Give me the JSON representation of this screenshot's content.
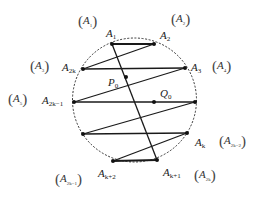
{
  "figure": {
    "type": "geometry-diagram",
    "circle": {
      "cx": 134.5,
      "cy": 100,
      "r": 62,
      "style": "dashed"
    },
    "points": [
      {
        "id": "A1",
        "x": 112,
        "y": 44
      },
      {
        "id": "A2",
        "x": 154,
        "y": 44
      },
      {
        "id": "A2k",
        "x": 83,
        "y": 69
      },
      {
        "id": "A3",
        "x": 185,
        "y": 68
      },
      {
        "id": "P0",
        "x": 126,
        "y": 77
      },
      {
        "id": "A2k-1",
        "x": 74,
        "y": 102
      },
      {
        "id": "Q0",
        "x": 154,
        "y": 102
      },
      {
        "id": "R",
        "x": 195,
        "y": 102
      },
      {
        "id": "L",
        "x": 83,
        "y": 134
      },
      {
        "id": "Ak",
        "x": 187,
        "y": 133
      },
      {
        "id": "Ak+2",
        "x": 113,
        "y": 161
      },
      {
        "id": "Ak+1",
        "x": 157,
        "y": 160
      }
    ],
    "segments": [
      [
        "A1",
        "A2"
      ],
      [
        "A2",
        "A2k"
      ],
      [
        "A2k",
        "A3"
      ],
      [
        "A3",
        "A2k-1"
      ],
      [
        "A2k-1",
        "R"
      ],
      [
        "R",
        "L"
      ],
      [
        "L",
        "Ak"
      ],
      [
        "Ak",
        "Ak+2"
      ],
      [
        "Ak+2",
        "Ak+1"
      ],
      [
        "A1",
        "Ak+1"
      ]
    ]
  },
  "labels": {
    "A1": {
      "base": "A",
      "sub": "1"
    },
    "A2": {
      "base": "A",
      "sub": "2"
    },
    "A3": {
      "base": "A",
      "sub": "3"
    },
    "A2k": {
      "base": "A",
      "sub": "2k"
    },
    "A2k_1": {
      "base": "A",
      "sub": "2k−1"
    },
    "P0": {
      "base": "P",
      "sub": "0"
    },
    "Q0": {
      "base": "Q",
      "sub": "0"
    },
    "Ak": {
      "base": "A",
      "sub": "k"
    },
    "Ak1": {
      "base": "A",
      "sub": "k+1"
    },
    "Ak2": {
      "base": "A",
      "sub": "k+2"
    }
  },
  "paren_labels": {
    "p1": {
      "open": "(",
      "base": "A",
      "sub": "1",
      "close": ")"
    },
    "p2": {
      "open": "(",
      "base": "A",
      "sub": "2",
      "close": ")"
    },
    "p3": {
      "open": "(",
      "base": "A",
      "sub": "3",
      "close": ")"
    },
    "p4": {
      "open": "(",
      "base": "A",
      "sub": "4",
      "close": ")"
    },
    "p5": {
      "open": "(",
      "base": "A",
      "sub": "5",
      "close": ")"
    },
    "p2k2": {
      "open": "(",
      "base": "A",
      "sub": "2k−2",
      "close": ")"
    },
    "p2k1": {
      "open": "(",
      "base": "A",
      "sub": "2k−1",
      "close": ")"
    },
    "p2k": {
      "open": "(",
      "base": "A",
      "sub": "2k",
      "close": ")"
    }
  },
  "colors": {
    "line": "#1a1a1a",
    "circle": "#333333",
    "point": "#111111",
    "background": "#ffffff"
  }
}
